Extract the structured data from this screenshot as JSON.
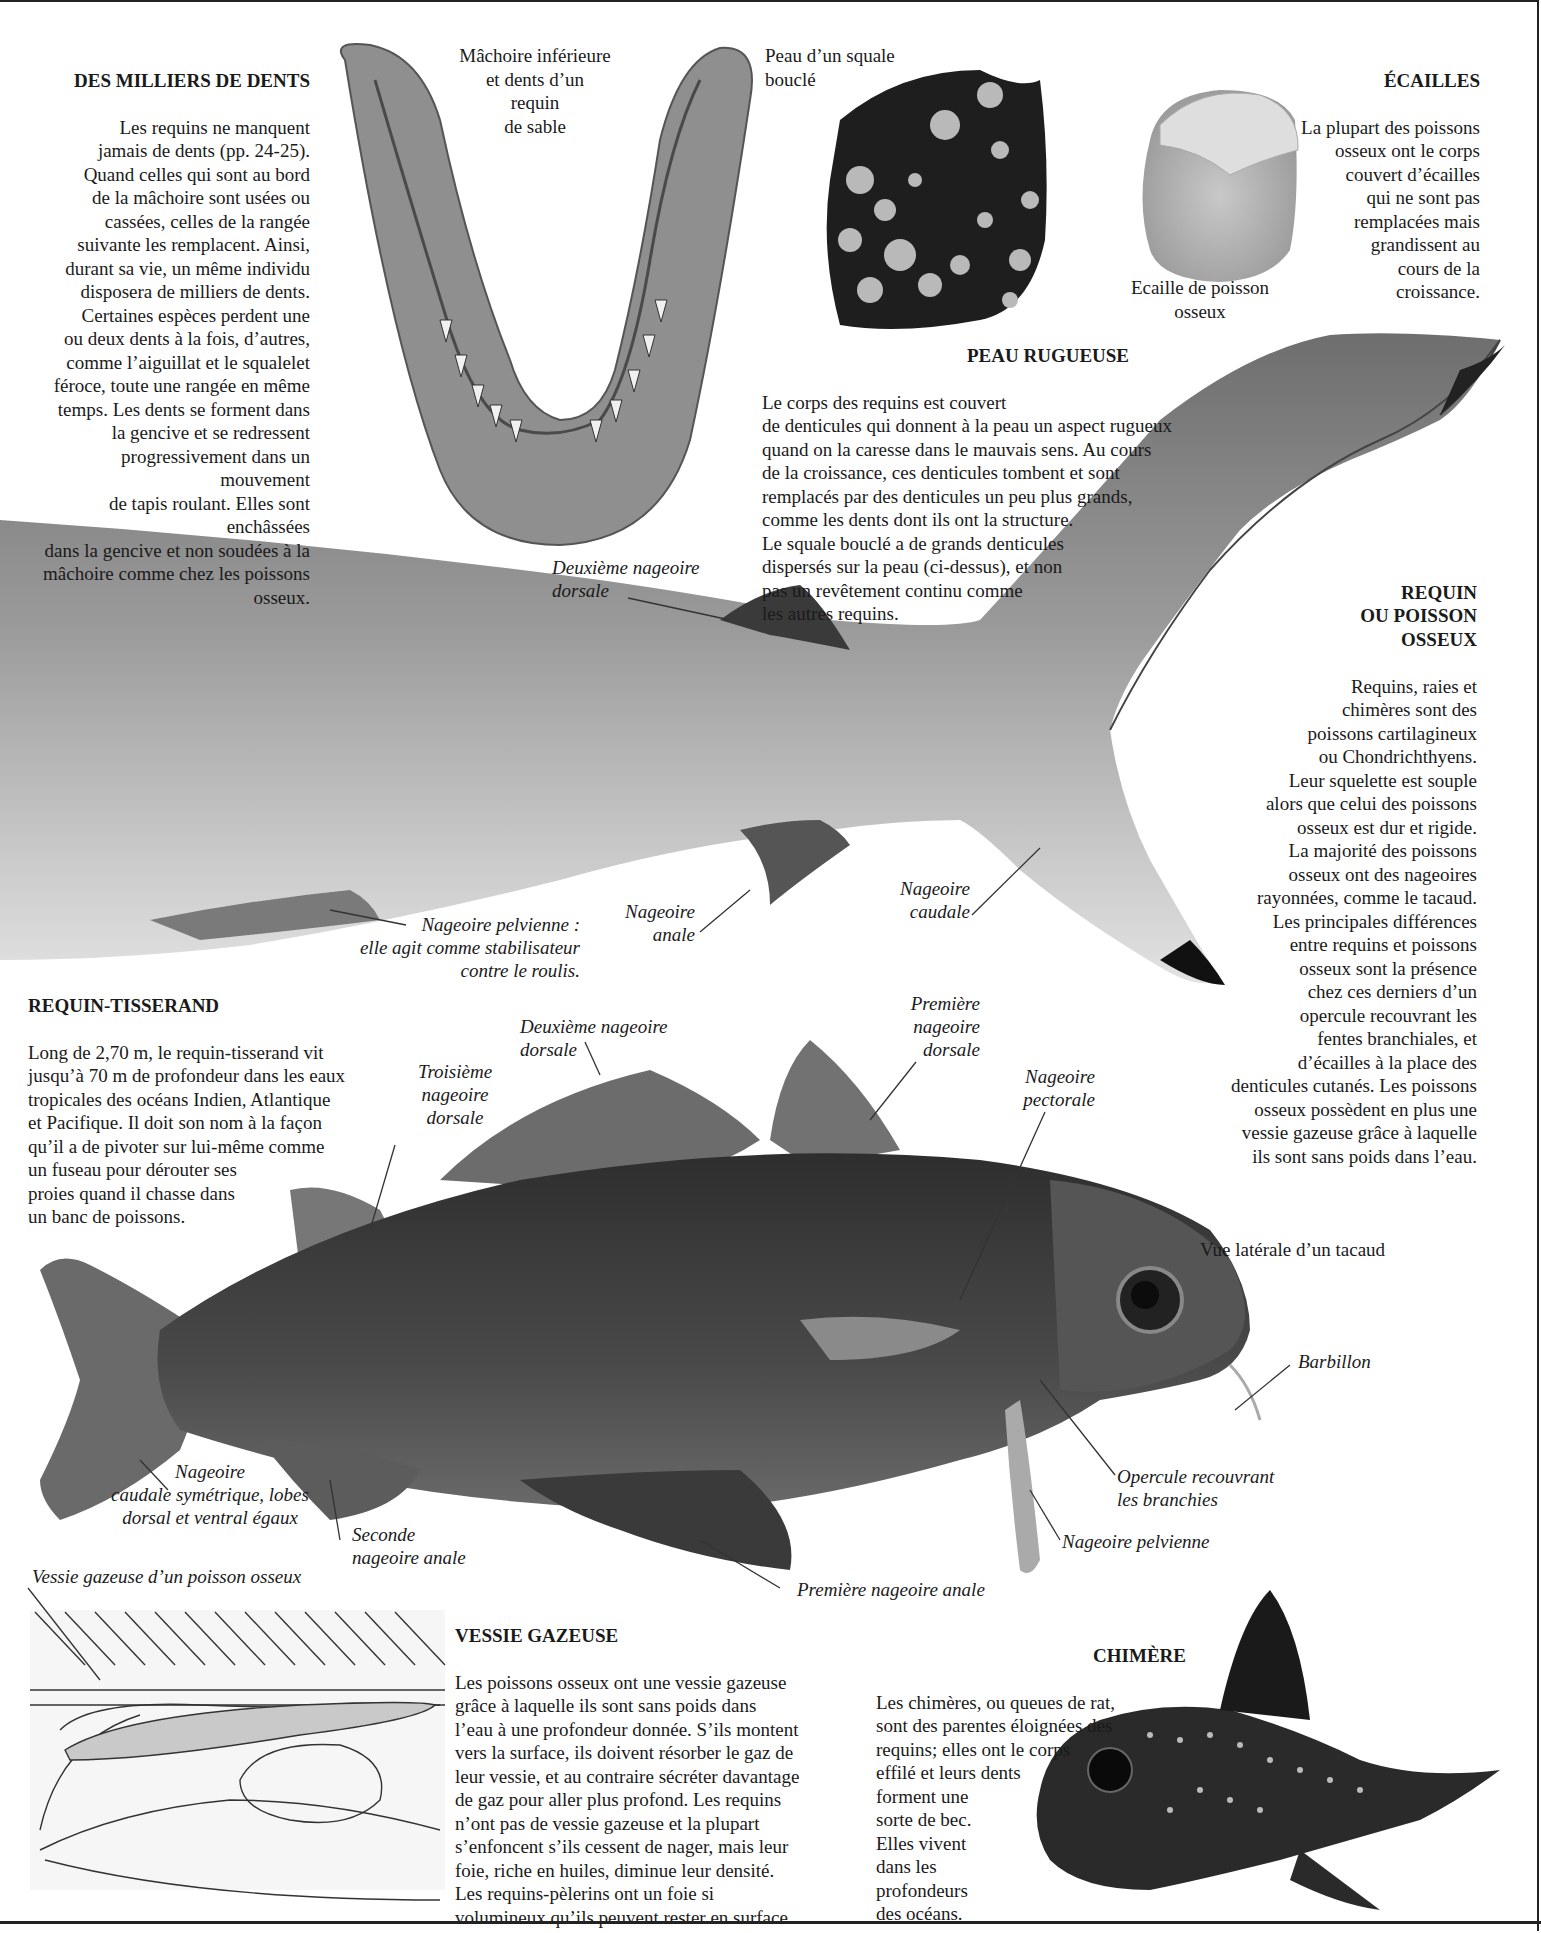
{
  "sections": {
    "teeth": {
      "heading": "DES MILLIERS DE DENTS",
      "body": "Les requins ne manquent\njamais de dents (pp. 24-25).\nQuand celles qui sont au bord\nde la mâchoire sont usées ou\ncassées, celles de la rangée\nsuivante les remplacent. Ainsi,\ndurant sa vie, un même individu\ndisposera de milliers de dents.\nCertaines espèces perdent une\nou deux dents à la fois, d’autres,\ncomme l’aiguillat et le squalelet\nféroce, toute une rangée en même\ntemps. Les dents se forment dans\nla gencive et se redressent\nprogressivement dans un mouvement\nde tapis roulant. Elles sont enchâssées\ndans la gencive et non soudées à la\nmâchoire comme chez les poissons osseux."
    },
    "scales": {
      "heading": "ÉCAILLES",
      "body": "La plupart des poissons\nosseux ont le corps\ncouvert d’écailles\nqui ne sont pas\nremplacées mais\ngrandissent au\ncours de la\ncroissance."
    },
    "rough_skin": {
      "heading": "PEAU RUGUEUSE",
      "body": "Le corps des requins est couvert\nde denticules qui donnent à la peau un aspect rugueux\nquand on la caresse dans le mauvais sens. Au cours\nde la croissance, ces denticules tombent et sont\nremplacés par des denticules un peu plus grands,\ncomme les dents dont ils ont la structure.\nLe squale bouclé a de grands denticules\ndispersés sur la peau (ci-dessus), et non\npas un revêtement continu comme\nles autres requins."
    },
    "shark_or_bony": {
      "heading": "REQUIN\nOU POISSON\nOSSEUX",
      "body": "Requins, raies et\nchimères sont des\npoissons cartilagineux\nou Chondrichthyens.\nLeur squelette est souple\nalors que celui des poissons\nosseux est dur et rigide.\nLa majorité des poissons\nosseux ont des nageoires\nrayonnées, comme le tacaud.\nLes principales différences\nentre requins et poissons\nosseux sont la présence\nchez ces derniers d’un\nopercule recouvrant les\nfentes branchiales, et\nd’écailles à la place des\ndenticules cutanés. Les poissons\nosseux possèdent en plus une\nvessie gazeuse grâce à laquelle\nils sont sans poids dans l’eau."
    },
    "spinner_shark": {
      "heading": "REQUIN-TISSERAND",
      "body": "Long de 2,70 m, le requin-tisserand vit\njusqu’à 70 m de profondeur dans les eaux\ntropicales des océans Indien, Atlantique\net Pacifique. Il doit son nom à la façon\nqu’il a de pivoter sur lui-même comme\nun fuseau pour dérouter ses\nproies quand il chasse dans\nun banc de poissons."
    },
    "swim_bladder": {
      "heading": "VESSIE GAZEUSE",
      "body": "Les poissons osseux ont une vessie gazeuse\ngrâce à laquelle ils sont sans poids dans\nl’eau à une profondeur donnée. S’ils montent\nvers la surface, ils doivent résorber le gaz de\nleur vessie, et au contraire sécréter davantage\nde gaz pour aller plus profond. Les requins\nn’ont pas de vessie gazeuse et la plupart\ns’enfoncent s’ils cessent de nager, mais leur\nfoie, riche en huiles, diminue leur densité.\nLes requins-pèlerins ont un foie si\nvolumineux qu’ils peuvent rester en surface."
    },
    "chimaera": {
      "heading": "CHIMÈRE",
      "body": "Les chimères, ou queues de rat,\nsont des parentes éloignées des\nrequins; elles ont le corps\neffilé et leurs dents\nforment une\nsorte de bec.\nElles vivent\ndans les\nprofondeurs\ndes océans."
    }
  },
  "captions": {
    "jaw": "Mâchoire inférieure\net dents d’un\nrequin\nde sable",
    "skin": "Peau d’un squale\nbouclé",
    "scale": "Ecaille de poisson\nosseux",
    "pout": "Vue latérale d’un tacaud",
    "bladder": "Vessie gazeuse d’un poisson osseux"
  },
  "shark_labels": {
    "second_dorsal": "Deuxième nageoire\ndorsale",
    "pelvic": "Nageoire pelvienne :\nelle agit comme stabilisateur\ncontre le roulis.",
    "anal": "Nageoire\nanale",
    "caudal": "Nageoire\ncaudale"
  },
  "fish_labels": {
    "second_dorsal": "Deuxième nageoire\ndorsale",
    "first_dorsal": "Première\nnageoire\ndorsale",
    "third_dorsal": "Troisième\nnageoire\ndorsale",
    "pectoral": "Nageoire\npectorale",
    "barbel": "Barbillon",
    "operculum": "Opercule recouvrant\nles branchies",
    "pelvic": "Nageoire pelvienne",
    "caudal": "Nageoire\ncaudale symétrique, lobes\ndorsal et ventral égaux",
    "second_anal": "Seconde\nnageoire anale",
    "first_anal": "Première nageoire anale"
  },
  "colors": {
    "ink": "#1a1a1a",
    "shark_body": "#8a8a8a",
    "fish_body": "#3c3c3c",
    "skin_dark": "#1e1e1e",
    "denticle": "#b9b9b9"
  }
}
